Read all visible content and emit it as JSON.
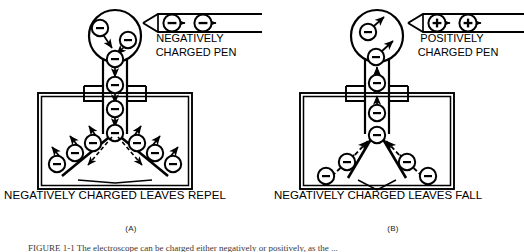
{
  "figure": {
    "type": "electroscope-charging-diagram",
    "style": "black-and-white line art",
    "caption_partial": "FIGURE 1-1   The electroscope can be charged either negatively or positively, as the ...",
    "panels": [
      {
        "id": "A",
        "panel_label": "(A)",
        "pen": {
          "label_line1": "NEGATIVELY",
          "label_line2": "CHARGED PEN",
          "charge_symbols": [
            "−",
            "−"
          ],
          "charge_sign": "minus",
          "arrow_direction": "left-toward-tip"
        },
        "bottom_caption": "NEGATIVELY CHARGED LEAVES REPEL",
        "bulb_charges": [
          "−",
          "−"
        ],
        "stem_charges": [
          "−",
          "−",
          "−",
          "−",
          "−"
        ],
        "leaf_charges": [
          "−",
          "−",
          "−",
          "−",
          "−",
          "−"
        ],
        "leaf_state": "spread-apart",
        "electron_flow": "downward-into-leaves"
      },
      {
        "id": "B",
        "panel_label": "(B)",
        "pen": {
          "label_line1": "POSITIVELY",
          "label_line2": "CHARGED PEN",
          "charge_symbols": [
            "+",
            "+"
          ],
          "charge_sign": "plus",
          "arrow_direction": "left-toward-tip"
        },
        "bottom_caption": "NEGATIVELY CHARGED LEAVES FALL",
        "bulb_charges": [
          "−",
          "−"
        ],
        "stem_charges": [
          "−",
          "−",
          "−"
        ],
        "leaf_charges": [
          "−",
          "−",
          "−",
          "−"
        ],
        "leaf_state": "hanging-down",
        "electron_flow": "upward-out-of-leaves"
      }
    ],
    "colors": {
      "ink": "#000000",
      "background": "#ffffff",
      "caption_text": "#1a1a1a"
    }
  }
}
